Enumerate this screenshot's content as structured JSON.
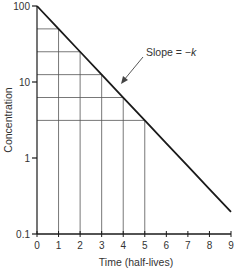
{
  "chart_data": {
    "type": "line",
    "title": "",
    "xlabel": "Time (half-lives)",
    "ylabel": "Concentration",
    "yscale": "log",
    "xlim": [
      0,
      9
    ],
    "ylim": [
      0.1,
      100
    ],
    "x_ticks": [
      0,
      1,
      2,
      3,
      4,
      5,
      6,
      7,
      8,
      9
    ],
    "y_ticks": [
      0.1,
      1,
      10,
      100
    ],
    "y_tick_labels": [
      "0.1",
      "1",
      "10",
      "100"
    ],
    "grid": "half-life guide lines for t = 1..5",
    "series": [
      {
        "name": "Concentration",
        "x": [
          0,
          1,
          2,
          3,
          4,
          5,
          6,
          7,
          8,
          9
        ],
        "values": [
          100,
          50,
          25,
          12.5,
          6.25,
          3.125,
          1.5625,
          0.78,
          0.39,
          0.195
        ]
      }
    ],
    "guides": {
      "x": [
        1,
        2,
        3,
        4,
        5
      ],
      "y": [
        50,
        25,
        12.5,
        6.25,
        3.125
      ]
    },
    "annotations": [
      {
        "text": "Slope = −k",
        "text_prefix": "Slope = −",
        "text_italic": "k",
        "arrow_to": [
          3.6,
          8.5
        ]
      }
    ],
    "legend": "none"
  },
  "labels": {
    "xlabel": "Time (half-lives)",
    "ylabel": "Concentration",
    "slope_prefix": "Slope = −",
    "slope_var": "k",
    "x_ticks": [
      "0",
      "1",
      "2",
      "3",
      "4",
      "5",
      "6",
      "7",
      "8",
      "9"
    ],
    "y_ticks": [
      "0.1",
      "1",
      "10",
      "100"
    ]
  },
  "colors": {
    "line": "#1a1a1a",
    "grid": "#555555",
    "text": "#333333"
  }
}
